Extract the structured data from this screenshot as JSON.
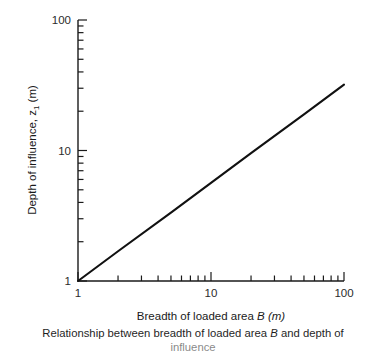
{
  "figure": {
    "background_color": "#ffffff",
    "axis_color": "#1a1a1a",
    "line_color": "#111111"
  },
  "axes": {
    "x_title_prefix": "Breadth of loaded area ",
    "x_title_symbol": "B",
    "x_title_units": " (m)",
    "y_title_prefix": "Depth of influence, z",
    "y_title_subscript": "1",
    "y_title_units": " (m)"
  },
  "caption": {
    "line1_a": "Relationship between breadth of loaded area ",
    "line1_symbol": "B",
    "line1_b": " and depth of",
    "line2": "influence"
  },
  "chart_data": {
    "type": "line",
    "title": "",
    "xlabel": "Breadth of loaded area B (m)",
    "ylabel": "Depth of influence, z1 (m)",
    "xscale": "log",
    "yscale": "log",
    "xlim": [
      1,
      100
    ],
    "ylim": [
      1,
      100
    ],
    "grid": false,
    "legend": "none",
    "x_major_ticks": [
      1,
      10,
      100
    ],
    "x_major_tick_labels": [
      "1",
      "10",
      "100"
    ],
    "y_major_ticks": [
      1,
      10,
      100
    ],
    "y_major_tick_labels": [
      "1",
      "10",
      "100"
    ],
    "x_minor_ticks": [
      2,
      3,
      4,
      5,
      6,
      7,
      8,
      9,
      20,
      30,
      40,
      50,
      60,
      70,
      80,
      90
    ],
    "y_minor_ticks": [
      2,
      3,
      4,
      5,
      6,
      7,
      8,
      9,
      20,
      30,
      40,
      50,
      60,
      70,
      80,
      90
    ],
    "series": [
      {
        "name": "Depth of influence",
        "relationship": "power law, straight on log-log",
        "x": [
          1,
          2,
          5,
          10,
          20,
          50,
          100
        ],
        "y": [
          1.0,
          1.69,
          3.34,
          5.65,
          9.55,
          18.9,
          32.0
        ]
      }
    ]
  }
}
